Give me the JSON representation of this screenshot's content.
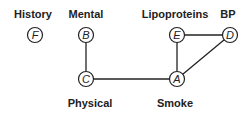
{
  "diagram": {
    "nodes": [
      {
        "id": "F",
        "label": "History",
        "x": 35,
        "y": 35,
        "label_x": 33,
        "label_y": 8
      },
      {
        "id": "B",
        "label": "Mental",
        "x": 86,
        "y": 35,
        "label_x": 86,
        "label_y": 8
      },
      {
        "id": "E",
        "label": "Lipoproteins",
        "x": 177,
        "y": 35,
        "label_x": 175,
        "label_y": 8
      },
      {
        "id": "D",
        "label": "BP",
        "x": 230,
        "y": 35,
        "label_x": 228,
        "label_y": 8
      },
      {
        "id": "C",
        "label": "Physical",
        "x": 86,
        "y": 79,
        "label_x": 90,
        "label_y": 97
      },
      {
        "id": "A",
        "label": "Smoke",
        "x": 177,
        "y": 79,
        "label_x": 175,
        "label_y": 97
      }
    ],
    "edges": [
      [
        "B",
        "C"
      ],
      [
        "C",
        "A"
      ],
      [
        "A",
        "E"
      ],
      [
        "E",
        "D"
      ],
      [
        "A",
        "D"
      ]
    ],
    "colors": {
      "stroke": "#222222",
      "text": "#222222",
      "background": "#ffffff"
    }
  }
}
